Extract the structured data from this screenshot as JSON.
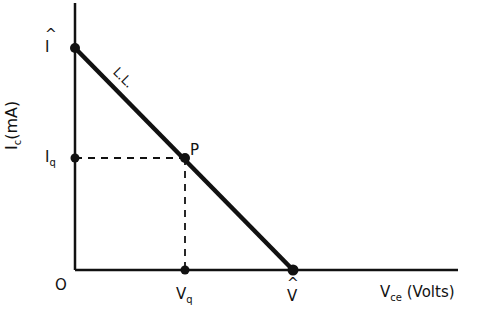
{
  "diagram": {
    "type": "load-line",
    "y_axis_label": "I",
    "y_axis_label_sub": "c",
    "y_axis_unit": "(mA)",
    "x_axis_label": "V",
    "x_axis_label_sub": "ce",
    "x_axis_unit": "(Volts)",
    "origin_label": "O",
    "y_intercept_label": "I",
    "x_intercept_label": "V",
    "iq_label": "I",
    "iq_sub": "q",
    "vq_label": "V",
    "vq_sub": "q",
    "point_label": "P",
    "line_label": "L.L.",
    "colors": {
      "ink": "#111111",
      "background": "#ffffff"
    }
  }
}
